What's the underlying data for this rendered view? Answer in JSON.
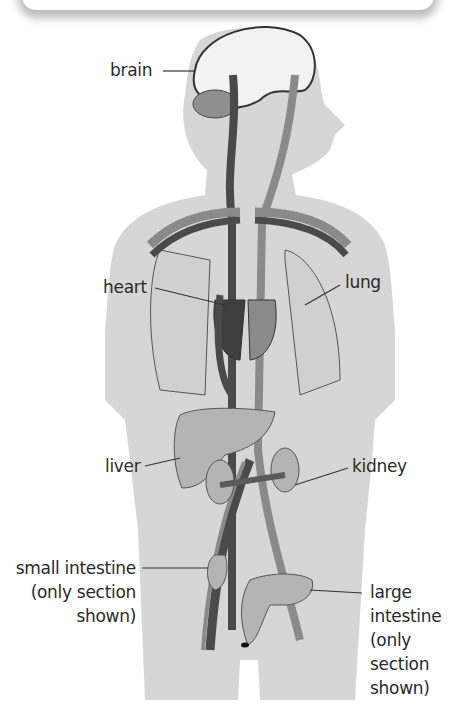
{
  "diagram": {
    "type": "human circulatory system",
    "colors": {
      "body": "#d6d6d6",
      "artery": "#8a8a8a",
      "vein": "#4a4a4a",
      "organ": "#b4b4b4",
      "outline": "#555555",
      "label_text": "#2a2a2a"
    },
    "labels": {
      "brain": "brain",
      "heart": "heart",
      "lung": "lung",
      "liver": "liver",
      "kidney": "kidney",
      "small_intestine": [
        "small intestine",
        "(only section",
        "shown)"
      ],
      "large_intestine": [
        "large",
        "intestine",
        "(only",
        "section",
        "shown)"
      ]
    }
  }
}
